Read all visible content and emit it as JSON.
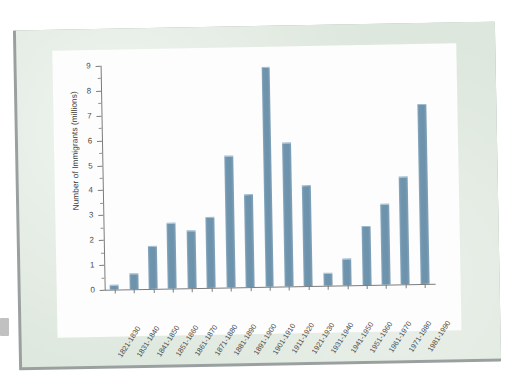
{
  "slide": {
    "background_color": "#dde7dd",
    "card_color": "#fdfdfd"
  },
  "chart_data": {
    "type": "bar",
    "title": "",
    "xlabel": "",
    "ylabel": "Number of Immigrants (millions)",
    "ylim": [
      0,
      9
    ],
    "y_ticks": [
      0,
      1,
      2,
      3,
      4,
      5,
      6,
      7,
      8,
      9
    ],
    "y_tick_labels": [
      "0",
      "1",
      "2",
      "3",
      "4",
      "5",
      "6",
      "7",
      "8",
      "9"
    ],
    "grid": false,
    "legend": "none",
    "bar_color": "#6f93ad",
    "categories": [
      "1821-1830",
      "1831-1840",
      "1841-1850",
      "1851-1860",
      "1861-1870",
      "1871-1880",
      "1881-1890",
      "1891-1900",
      "1901-1910",
      "1911-1920",
      "1921-1930",
      "1931-1940",
      "1941-1950",
      "1951-1960",
      "1961-1970",
      "1971-1980",
      "1981-1990"
    ],
    "values": [
      0.15,
      0.6,
      1.7,
      2.6,
      2.3,
      2.8,
      5.25,
      3.7,
      8.8,
      5.75,
      4.0,
      0.5,
      1.05,
      2.35,
      3.2,
      4.3,
      7.2
    ]
  }
}
